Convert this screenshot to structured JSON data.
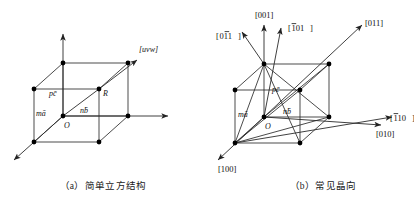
{
  "page": {
    "top_partial_text": "—— —— ————",
    "background_color": "#ffffff",
    "line_color": "#222222",
    "node_color": "#000000"
  },
  "figure_a": {
    "caption": "（a）简单立方结构",
    "labels": {
      "origin": "O",
      "vector_a": "mā",
      "vector_b": "nb̄",
      "vector_c": "pc̄",
      "point_r": "R",
      "direction": "[uvw]"
    }
  },
  "figure_b": {
    "caption": "（b）常见晶向",
    "labels": {
      "origin": "O",
      "vector_a": "mā",
      "vector_b": "nb̄",
      "vector_c": "pc̄"
    },
    "directions": [
      {
        "id": "d001",
        "text": "[001]"
      },
      {
        "id": "d_101",
        "text": "[̄1̄01]",
        "display": "[101]",
        "bar_over": "1",
        "pos": 0
      },
      {
        "id": "d0_11",
        "text": "[011]",
        "bar_over": "1",
        "pos": 1
      },
      {
        "id": "d011",
        "text": "[011]"
      },
      {
        "id": "d_110",
        "text": "[110]",
        "bar_over": "1",
        "pos": 0
      },
      {
        "id": "d010",
        "text": "[010]"
      },
      {
        "id": "d100",
        "text": "[100]"
      }
    ],
    "direction_plain": {
      "d001": "[001]",
      "d_101": "101",
      "d0_11": "011",
      "d011": "[011]",
      "d_110": "110",
      "d010": "[010]",
      "d100": "[100]"
    }
  }
}
